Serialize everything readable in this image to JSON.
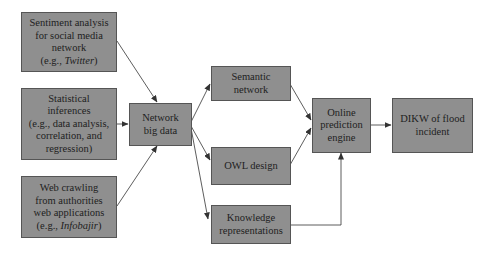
{
  "diagram": {
    "nodes": [
      {
        "id": "sentiment",
        "label_main": "Sentiment analysis\nfor social media\nnetwork\n(e.g., ",
        "label_italic": "Twitter",
        "label_end": ")"
      },
      {
        "id": "statistical",
        "label_main": "Statistical\ninferences\n(e.g., data analysis,\ncorrelation, and\nregression)"
      },
      {
        "id": "webcrawl",
        "label_main": "Web crawling\nfrom authorities\nweb applications\n(e.g., ",
        "label_italic": "Infobajir",
        "label_end": ")"
      },
      {
        "id": "network",
        "label_main": "Network\nbig data"
      },
      {
        "id": "semantic",
        "label_main": "Semantic\nnetwork"
      },
      {
        "id": "owl",
        "label_main": "OWL design"
      },
      {
        "id": "knowledge",
        "label_main": "Knowledge\nrepresentations"
      },
      {
        "id": "online",
        "label_main": "Online\nprediction\nengine"
      },
      {
        "id": "dikw",
        "label_main": "DIKW of flood\nincident"
      }
    ],
    "edges": [
      {
        "from": "sentiment",
        "to": "network"
      },
      {
        "from": "statistical",
        "to": "network"
      },
      {
        "from": "webcrawl",
        "to": "network"
      },
      {
        "from": "network",
        "to": "semantic"
      },
      {
        "from": "network",
        "to": "owl"
      },
      {
        "from": "network",
        "to": "knowledge"
      },
      {
        "from": "semantic",
        "to": "online"
      },
      {
        "from": "owl",
        "to": "online"
      },
      {
        "from": "knowledge",
        "to": "online"
      },
      {
        "from": "online",
        "to": "dikw"
      }
    ],
    "colors": {
      "node_fill": "#8f8f8f",
      "node_border": "#555555",
      "text": "#1e1e1e",
      "edge": "#333333"
    }
  }
}
